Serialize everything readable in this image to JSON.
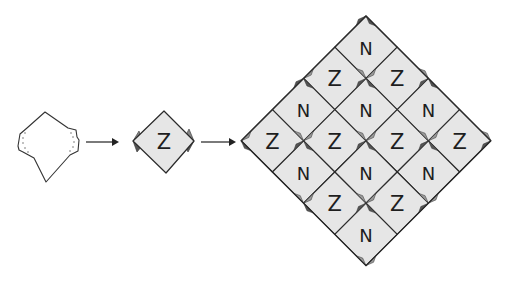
{
  "diagram": {
    "type": "folding-tessellation-sequence",
    "steps": [
      {
        "id": "crease-pattern",
        "description": "Unfolded square with pleated corners (dotted fold lines)"
      },
      {
        "id": "single-tile",
        "label": "Z",
        "description": "Single folded tile"
      },
      {
        "id": "tiled-grid",
        "description": "4x4 tessellation of tiles",
        "rows": 4,
        "cols": 4
      }
    ],
    "arrows": [
      {
        "from": "crease-pattern",
        "to": "single-tile"
      },
      {
        "from": "single-tile",
        "to": "tiled-grid"
      }
    ],
    "tile_label_single": "Z",
    "grid_labels": [
      [
        "N",
        "Z",
        "N",
        "Z"
      ],
      [
        "Z",
        "N",
        "Z",
        "N"
      ],
      [
        "N",
        "Z",
        "N",
        "Z"
      ],
      [
        "Z",
        "N",
        "Z",
        "N"
      ]
    ],
    "colors": {
      "tile_fill": "#e6e6e6",
      "stroke": "#2a2a2a",
      "flap_dark": "#555555",
      "flap_light": "#9a9a9a",
      "background": "#ffffff"
    }
  }
}
